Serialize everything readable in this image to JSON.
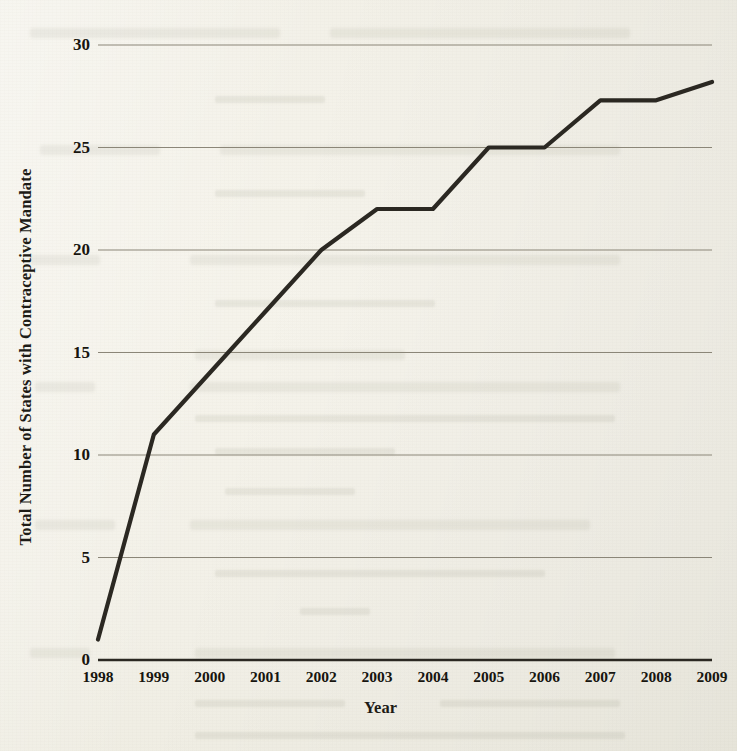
{
  "page": {
    "media": "scanned-book-page",
    "paper_color": "#f2f0e7",
    "ink_color": "#2b2822"
  },
  "chart_data": {
    "type": "line",
    "title": "",
    "xlabel": "Year",
    "ylabel": "Total Number of States with Contraceptive Mandate",
    "categories": [
      "1998",
      "1999",
      "2000",
      "2001",
      "2002",
      "2003",
      "2004",
      "2005",
      "2006",
      "2007",
      "2008",
      "2009"
    ],
    "values": [
      1,
      11,
      14,
      17,
      20,
      22,
      22,
      25,
      25,
      27.3,
      27.3,
      28.2
    ],
    "series": [
      {
        "name": "Total Number of States with Contraceptive Mandate",
        "values": [
          1,
          11,
          14,
          17,
          20,
          22,
          22,
          25,
          25,
          27.3,
          27.3,
          28.2
        ]
      }
    ],
    "xlim": [
      1998,
      2009
    ],
    "ylim": [
      0,
      30
    ],
    "ytick_labels": [
      "0",
      "5",
      "10",
      "15",
      "20",
      "25",
      "30"
    ],
    "ytick_values": [
      0,
      5,
      10,
      15,
      20,
      25,
      30
    ],
    "xtick_labels": [
      "1998",
      "1999",
      "2000",
      "2001",
      "2002",
      "2003",
      "2004",
      "2005",
      "2006",
      "2007",
      "2008",
      "2009"
    ],
    "grid": true,
    "grid_axis": "y",
    "legend": false,
    "legend_position": "none",
    "line_color": "#2b2822",
    "line_width": 4,
    "markers": false,
    "annotations": []
  }
}
